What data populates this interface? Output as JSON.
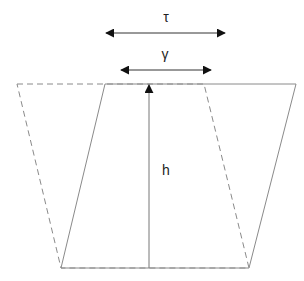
{
  "diagram": {
    "labels": {
      "tau": "τ",
      "gamma": "γ",
      "height": "h"
    },
    "colors": {
      "outline": "#8a8a8a",
      "dashed": "#8a8a8a",
      "arrow": "#111111"
    }
  }
}
